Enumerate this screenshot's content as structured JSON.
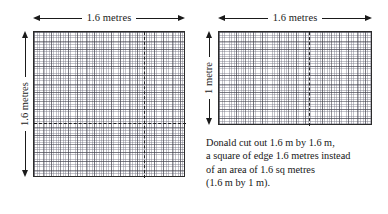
{
  "diagram": {
    "left_panel": {
      "name": "square-1.6-by-1.6",
      "top_dimension_label": "1.6 metres",
      "side_dimension_label": "1.6 metres",
      "shape": "square",
      "grid": {
        "minor_cells_x": 88,
        "minor_cells_y": 85,
        "major_every": 5
      },
      "guides": {
        "vertical_dash": true,
        "horizontal_dash": true
      }
    },
    "right_panel": {
      "name": "rectangle-1.6-by-1",
      "top_dimension_label": "1.6 metres",
      "side_dimension_label": "1 metre",
      "shape": "rectangle",
      "grid": {
        "minor_cells_x": 89,
        "minor_cells_y": 54,
        "major_every": 5
      },
      "guides": {
        "vertical_dash": true,
        "horizontal_dash": false
      }
    },
    "caption": {
      "lines": [
        "Donald cut out 1.6 m by 1.6 m,",
        "a square of edge 1.6 metres instead",
        "of an  area of 1.6 sq metres",
        "(1.6 m by 1 m)."
      ],
      "line_1": "Donald cut out 1.6 m by 1.6 m,",
      "line_2": "a square of edge 1.6 metres instead",
      "line_3": "of an  area of 1.6 sq metres",
      "line_4": "(1.6 m by 1 m)."
    },
    "colors": {
      "ink": "#1a1a1a",
      "grid_major": "#3c3c46",
      "grid_minor": "#6e6e7d",
      "border": "#2b2b2b",
      "background": "#ffffff"
    }
  }
}
